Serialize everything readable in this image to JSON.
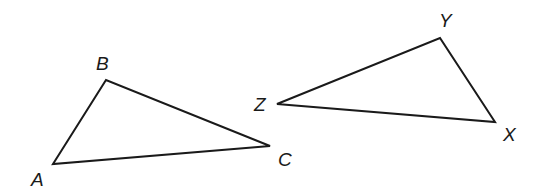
{
  "diagram": {
    "triangles": [
      {
        "name": "ABC",
        "vertices": [
          {
            "label": "A",
            "x": 53,
            "y": 164,
            "lx": 31,
            "ly": 186
          },
          {
            "label": "B",
            "x": 106,
            "y": 80,
            "lx": 96,
            "ly": 70
          },
          {
            "label": "C",
            "x": 270,
            "y": 146,
            "lx": 278,
            "ly": 166
          }
        ]
      },
      {
        "name": "XYZ",
        "vertices": [
          {
            "label": "X",
            "x": 495,
            "y": 122,
            "lx": 503,
            "ly": 141
          },
          {
            "label": "Y",
            "x": 440,
            "y": 38,
            "lx": 439,
            "ly": 27
          },
          {
            "label": "Z",
            "x": 277,
            "y": 104,
            "lx": 254,
            "ly": 111
          }
        ]
      }
    ],
    "stroke_color": "#1a1a1a",
    "background": "#ffffff"
  }
}
